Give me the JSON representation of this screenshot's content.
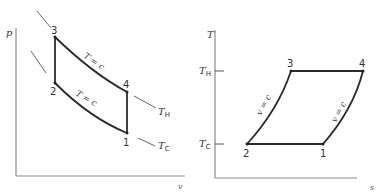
{
  "pv_diagram": {
    "y_axis_label": "p",
    "x_axis_label": "v",
    "points": [
      {
        "id": "1",
        "label": "1"
      },
      {
        "id": "2",
        "label": "2"
      },
      {
        "id": "3",
        "label": "3"
      },
      {
        "id": "4",
        "label": "4"
      }
    ],
    "upper_curve_label": "T = c",
    "lower_curve_label": "T = c",
    "hot_isotherm_label": "T",
    "hot_isotherm_sub": "H",
    "cold_isotherm_label": "T",
    "cold_isotherm_sub": "C"
  },
  "ts_diagram": {
    "y_axis_label": "T",
    "x_axis_label": "s",
    "tick_hot_label": "T",
    "tick_hot_sub": "H",
    "tick_cold_label": "T",
    "tick_cold_sub": "C",
    "points": [
      {
        "id": "1",
        "label": "1"
      },
      {
        "id": "2",
        "label": "2"
      },
      {
        "id": "3",
        "label": "3"
      },
      {
        "id": "4",
        "label": "4"
      }
    ],
    "left_curve_label": "v = c",
    "right_curve_label": "v = c"
  }
}
